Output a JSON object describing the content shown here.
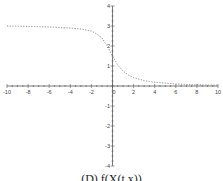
{
  "chart_data": {
    "type": "line",
    "title": "",
    "xlabel": "",
    "ylabel": "",
    "xlim": [
      -10,
      10
    ],
    "ylim": [
      -4,
      4
    ],
    "grid": false,
    "legend": null,
    "x_ticks": [
      -10,
      -8,
      -6,
      -4,
      -2,
      0,
      2,
      4,
      6,
      8,
      10
    ],
    "y_ticks": [
      -4,
      -3,
      -2,
      -1,
      0,
      1,
      2,
      3,
      4
    ],
    "series": [
      {
        "name": "curve",
        "style": "dotted",
        "color": "#888888",
        "x": [
          -10,
          -8,
          -6,
          -4,
          -3,
          -2,
          -1.5,
          -1,
          -0.5,
          0,
          0.5,
          1,
          1.5,
          2,
          3,
          4,
          6,
          8,
          10
        ],
        "y": [
          3.0,
          2.98,
          2.95,
          2.9,
          2.85,
          2.75,
          2.6,
          2.4,
          2.0,
          1.5,
          1.05,
          0.75,
          0.55,
          0.42,
          0.27,
          0.19,
          0.1,
          0.06,
          0.04
        ]
      }
    ]
  },
  "caption": "(D) f(X(t,x))",
  "colors": {
    "axis": "#555555",
    "curve": "#888888",
    "background": "#ffffff"
  }
}
